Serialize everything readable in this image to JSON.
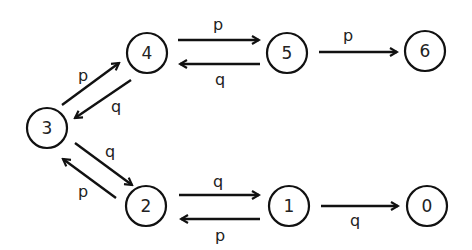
{
  "diagram": {
    "type": "state-transition-graph",
    "nodes": [
      {
        "id": "0",
        "label": "0",
        "x": 427,
        "y": 206
      },
      {
        "id": "1",
        "label": "1",
        "x": 289,
        "y": 206
      },
      {
        "id": "2",
        "label": "2",
        "x": 146,
        "y": 206
      },
      {
        "id": "3",
        "label": "3",
        "x": 47,
        "y": 128
      },
      {
        "id": "4",
        "label": "4",
        "x": 147,
        "y": 53
      },
      {
        "id": "5",
        "label": "5",
        "x": 287,
        "y": 53
      },
      {
        "id": "6",
        "label": "6",
        "x": 425,
        "y": 51
      }
    ],
    "edges": [
      {
        "from": "4",
        "to": "5",
        "label": "p"
      },
      {
        "from": "5",
        "to": "4",
        "label": "q"
      },
      {
        "from": "5",
        "to": "6",
        "label": "p"
      },
      {
        "from": "3",
        "to": "4",
        "label": "p"
      },
      {
        "from": "4",
        "to": "3",
        "label": "q"
      },
      {
        "from": "3",
        "to": "2",
        "label": "q"
      },
      {
        "from": "2",
        "to": "3",
        "label": "p"
      },
      {
        "from": "2",
        "to": "1",
        "label": "q"
      },
      {
        "from": "1",
        "to": "2",
        "label": "p"
      },
      {
        "from": "1",
        "to": "0",
        "label": "q"
      }
    ],
    "colors": {
      "stroke": "#111111",
      "text": "#222222",
      "background": "#ffffff"
    }
  }
}
